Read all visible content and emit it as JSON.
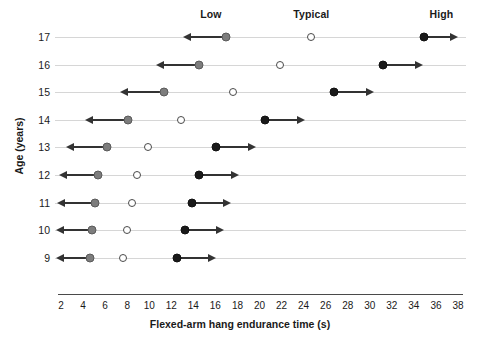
{
  "chart_data": {
    "type": "scatter",
    "title": "",
    "xlabel": "Flexed-arm hang endurance time (s)",
    "ylabel": "Age (years)",
    "xlim": [
      2,
      38
    ],
    "ylim": [
      9,
      17
    ],
    "xticks": [
      2,
      4,
      6,
      8,
      10,
      12,
      14,
      16,
      18,
      20,
      22,
      24,
      26,
      28,
      30,
      32,
      34,
      36,
      38
    ],
    "yticks": [
      17,
      16,
      15,
      14,
      13,
      12,
      11,
      10,
      9
    ],
    "grid": false,
    "legend_position": "top",
    "zone_labels": [
      {
        "label": "Low",
        "x": 15.6
      },
      {
        "label": "Typical",
        "x": 24.7
      },
      {
        "label": "High",
        "x": 36.5
      }
    ],
    "series": [
      {
        "name": "Low cut-off",
        "marker": "gray-filled-circle",
        "arrow": "left"
      },
      {
        "name": "Typical",
        "marker": "open-circle",
        "arrow": "none"
      },
      {
        "name": "High cut-off",
        "marker": "black-filled-circle",
        "arrow": "right"
      }
    ],
    "rows": [
      {
        "age": 17,
        "low": 17.0,
        "low_arrow_end": 13.2,
        "typical": 24.7,
        "high": 34.9,
        "high_arrow_end": 38.0
      },
      {
        "age": 16,
        "low": 14.5,
        "low_arrow_end": 10.8,
        "typical": 21.9,
        "high": 31.2,
        "high_arrow_end": 34.8
      },
      {
        "age": 15,
        "low": 11.3,
        "low_arrow_end": 7.5,
        "typical": 17.6,
        "high": 26.8,
        "high_arrow_end": 30.4
      },
      {
        "age": 14,
        "low": 8.1,
        "low_arrow_end": 4.4,
        "typical": 12.9,
        "high": 20.5,
        "high_arrow_end": 24.1
      },
      {
        "age": 13,
        "low": 6.2,
        "low_arrow_end": 2.6,
        "typical": 9.9,
        "high": 16.1,
        "high_arrow_end": 19.7
      },
      {
        "age": 12,
        "low": 5.4,
        "low_arrow_end": 2.0,
        "typical": 8.9,
        "high": 14.5,
        "high_arrow_end": 18.1
      },
      {
        "age": 11,
        "low": 5.1,
        "low_arrow_end": 1.8,
        "typical": 8.4,
        "high": 13.9,
        "high_arrow_end": 17.4
      },
      {
        "age": 10,
        "low": 4.8,
        "low_arrow_end": 1.7,
        "typical": 8.0,
        "high": 13.2,
        "high_arrow_end": 16.8
      },
      {
        "age": 9,
        "low": 4.6,
        "low_arrow_end": 1.7,
        "typical": 7.6,
        "high": 12.5,
        "high_arrow_end": 16.1
      }
    ],
    "colors": {
      "low_marker": "#7d7d7d",
      "typical_marker": "#ffffff",
      "high_marker": "#1a1a1a",
      "arrow": "#333333",
      "row_line": "#d6d6d6",
      "axis": "#4a4a4a",
      "text": "#1a1a1a"
    }
  }
}
